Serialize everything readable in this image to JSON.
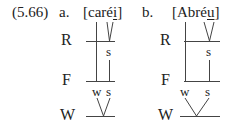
{
  "example": {
    "number": "(5.66)",
    "panels": [
      {
        "label": "a.",
        "word_prefix": "[caré",
        "word_underlined": "i",
        "word_suffix": "]",
        "tiers": [
          "R",
          "F",
          "W"
        ],
        "r_node": "s",
        "f_nodes": [
          "w",
          "s"
        ]
      },
      {
        "label": "b.",
        "word_prefix": "[Abré",
        "word_underlined": "u",
        "word_suffix": "]",
        "tiers": [
          "R",
          "F",
          "W"
        ],
        "r_node": "s",
        "f_nodes": [
          "w",
          "s"
        ]
      }
    ]
  },
  "colors": {
    "ink": "#222222",
    "background": "#ffffff"
  }
}
